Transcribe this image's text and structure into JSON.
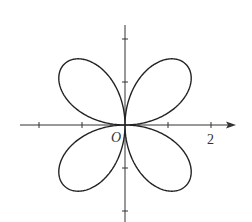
{
  "chart_data": {
    "type": "line",
    "title": "",
    "equation": "r = 2 sin(2θ)",
    "amplitude": 2,
    "petals": 4,
    "theta_range": [
      0,
      6.283185
    ],
    "xlabel": "",
    "ylabel": "",
    "xlim": [
      -2.5,
      2.5
    ],
    "ylim": [
      -2.2,
      2.8
    ],
    "origin_label": "O",
    "x_ticks": [
      -2,
      -1,
      1,
      2
    ],
    "y_ticks": [
      -2,
      -1,
      1,
      2
    ],
    "tick_labels": [
      {
        "axis": "x",
        "value": 2,
        "text": "2"
      }
    ],
    "grid": false,
    "colors": {
      "curve": "#222222",
      "axes": "#333333"
    }
  }
}
